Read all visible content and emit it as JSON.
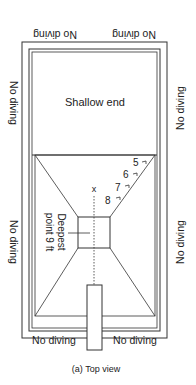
{
  "diagram": {
    "caption": "(a)  Top view",
    "shallow_label": "Shallow end",
    "deepest_label_line1": "Deepest",
    "deepest_label_line2": "point 9 ft",
    "centerline_marker": "x",
    "no_diving": {
      "top_left": "No diving",
      "top_right": "No diving",
      "left_upper": "No diving",
      "left_lower": "No diving",
      "right_upper": "No diving",
      "right_lower": "No diving",
      "bottom_left": "No diving",
      "bottom_right": "No diving"
    },
    "depth_markers": [
      "5",
      "6",
      "7",
      "8"
    ],
    "colors": {
      "line": "#333333",
      "text": "#222222",
      "background": "#ffffff"
    }
  }
}
